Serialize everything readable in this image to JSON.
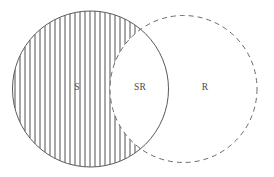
{
  "diagram": {
    "type": "venn-two-set",
    "canvas": {
      "width": 274,
      "height": 177,
      "background": "#ffffff"
    },
    "sets": [
      {
        "id": "S",
        "label": "S",
        "label_x": 77,
        "label_y": 88,
        "center_x": 90.5,
        "center_y": 89,
        "radius": 78,
        "outline_style": "solid",
        "outline_color": "#59595e",
        "outline_width": 1,
        "filled": true,
        "fill_style": "vertical-hatch"
      },
      {
        "id": "R",
        "label": "R",
        "label_x": 205,
        "label_y": 88,
        "center_x": 183.5,
        "center_y": 89,
        "radius": 73.5,
        "outline_style": "dashed",
        "outline_color": "#6a6a70",
        "outline_width": 1,
        "dash_length": 5,
        "dash_gap": 4,
        "filled": false,
        "fill_style": "none"
      }
    ],
    "intersection": {
      "id": "SR",
      "label": "SR",
      "label_x": 140,
      "label_y": 88,
      "filled": false,
      "fill_style": "none"
    },
    "shaded_region": {
      "id": "S-minus-R",
      "description": "S excluding the SR intersection",
      "fill_style": "vertical-hatch",
      "hatch_color": "#3c3c40",
      "hatch_spacing": 5,
      "hatch_width": 0.9,
      "hatch_orientation": "vertical"
    },
    "label_color": "#4a4a4a",
    "label_font_size": 9.5
  }
}
